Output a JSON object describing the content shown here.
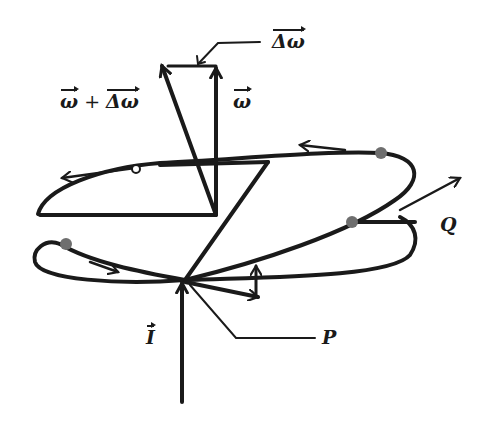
{
  "diagram": {
    "labels": {
      "delta_omega": "Δω",
      "omega_plus_delta": {
        "omega": "ω",
        "plus": " + ",
        "delta": "Δω"
      },
      "omega": "ω",
      "Q": "Q",
      "I": "I",
      "P": "P"
    },
    "colors": {
      "stroke": "#1a1a1a",
      "points": "#6e6e6e",
      "background": "#ffffff"
    }
  }
}
